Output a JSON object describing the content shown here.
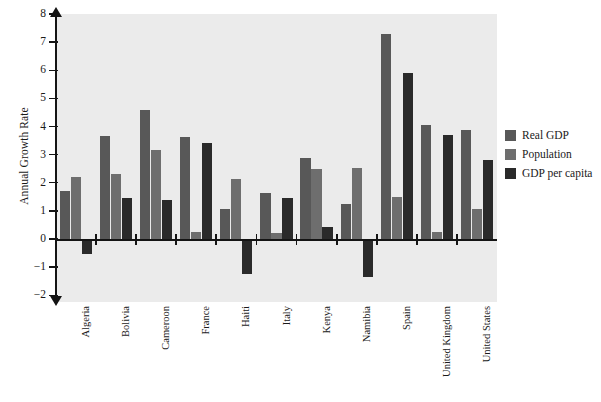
{
  "chart_data": {
    "type": "bar",
    "title": "",
    "xlabel": "",
    "ylabel": "Annual Growth Rate",
    "ylim": [
      -2,
      8
    ],
    "yticks": [
      8,
      7,
      6,
      5,
      4,
      3,
      2,
      1,
      0,
      -1,
      -2
    ],
    "ytick_labels": [
      "8",
      "7",
      "6",
      "5",
      "4",
      "3",
      "2",
      "1",
      "0",
      "−1",
      "−2"
    ],
    "grid": false,
    "legend_position": "right",
    "categories": [
      "Algeria",
      "Bolivia",
      "Cameroon",
      "France",
      "Haiti",
      "Italy",
      "Kenya",
      "Namibia",
      "Spain",
      "United Kingdom",
      "United States"
    ],
    "series": [
      {
        "name": "Real GDP",
        "color": "#585858",
        "values": [
          1.7,
          3.68,
          4.58,
          3.62,
          1.05,
          1.63,
          2.87,
          1.25,
          7.3,
          4.05,
          3.88
        ]
      },
      {
        "name": "Population",
        "color": "#6e6e6e",
        "values": [
          2.2,
          2.3,
          3.15,
          0.25,
          2.12,
          0.2,
          2.5,
          2.52,
          1.5,
          0.25,
          1.05
        ]
      },
      {
        "name": "GDP per capita",
        "color": "#2a2a2a",
        "values": [
          -0.55,
          1.45,
          1.4,
          3.4,
          -1.25,
          1.45,
          0.42,
          -1.35,
          5.9,
          3.7,
          2.82
        ]
      }
    ]
  },
  "legend": {
    "entries": [
      {
        "label": "Real GDP",
        "color": "#585858"
      },
      {
        "label": "Population",
        "color": "#6e6e6e"
      },
      {
        "label": "GDP per capita",
        "color": "#2a2a2a"
      }
    ]
  },
  "axis": {
    "y_title": "Annual Growth Rate"
  },
  "colors": {
    "panel_background": "#ebebeb",
    "axis": "#141414",
    "page_background": "#ffffff"
  }
}
